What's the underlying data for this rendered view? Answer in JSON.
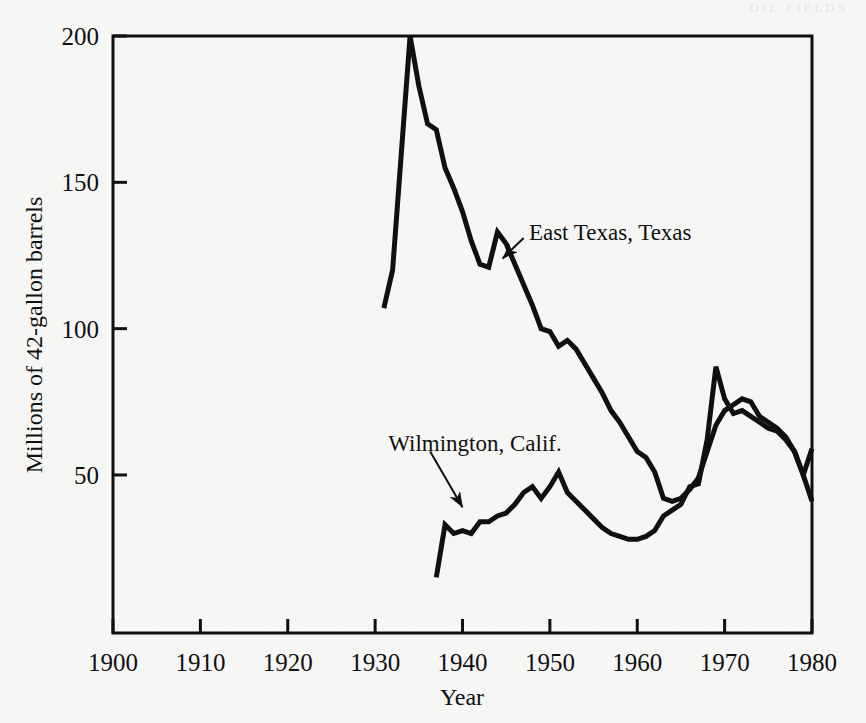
{
  "figure": {
    "page_header_fragment": "OIL FIELDS",
    "background_color": "#f6f6f4",
    "ink_color": "#101010"
  },
  "chart_data": {
    "type": "line",
    "title": "",
    "subtitle": "",
    "xlabel": "Year",
    "ylabel": "Millions of 42-gallon barrels",
    "xlim": [
      1900,
      1980
    ],
    "ylim": [
      -4,
      200
    ],
    "xticks": [
      1900,
      1910,
      1920,
      1930,
      1940,
      1950,
      1960,
      1970,
      1980
    ],
    "xtick_labels": [
      "1900",
      "1910",
      "1920",
      "1930",
      "1940",
      "1950",
      "1960",
      "1970",
      "1980"
    ],
    "yticks": [
      50,
      100,
      150,
      200
    ],
    "ytick_labels": [
      "50",
      "100",
      "150",
      "200"
    ],
    "grid": false,
    "legend_position": "inline-annotations",
    "frame": "box",
    "series": [
      {
        "name": "East Texas, Texas",
        "color": "#101010",
        "line_width": 5,
        "x": [
          1931,
          1932,
          1933,
          1934,
          1935,
          1936,
          1937,
          1938,
          1939,
          1940,
          1941,
          1942,
          1943,
          1944,
          1945,
          1946,
          1947,
          1948,
          1949,
          1950,
          1951,
          1952,
          1953,
          1954,
          1955,
          1956,
          1957,
          1958,
          1959,
          1960,
          1961,
          1962,
          1963,
          1964,
          1965,
          1966,
          1967,
          1968,
          1969,
          1970,
          1971,
          1972,
          1973,
          1974,
          1975,
          1976,
          1977,
          1978,
          1979,
          1980
        ],
        "y": [
          107,
          120,
          160,
          200,
          183,
          170,
          168,
          155,
          148,
          140,
          130,
          122,
          121,
          133,
          129,
          122,
          115,
          108,
          100,
          99,
          94,
          96,
          93,
          88,
          83,
          78,
          72,
          68,
          63,
          58,
          56,
          51,
          42,
          41,
          42,
          45,
          49,
          58,
          67,
          72,
          74,
          76,
          75,
          70,
          68,
          66,
          63,
          58,
          50,
          41
        ]
      },
      {
        "name": "Wilmington, Calif.",
        "color": "#101010",
        "line_width": 5,
        "x": [
          1937,
          1938,
          1939,
          1940,
          1941,
          1942,
          1943,
          1944,
          1945,
          1946,
          1947,
          1948,
          1949,
          1950,
          1951,
          1952,
          1953,
          1954,
          1955,
          1956,
          1957,
          1958,
          1959,
          1960,
          1961,
          1962,
          1963,
          1964,
          1965,
          1966,
          1967,
          1968,
          1969,
          1970,
          1971,
          1972,
          1973,
          1974,
          1975,
          1976,
          1977,
          1978,
          1979,
          1980
        ],
        "y": [
          15,
          33,
          30,
          31,
          30,
          34,
          34,
          36,
          37,
          40,
          44,
          46,
          42,
          46,
          51,
          44,
          41,
          38,
          35,
          32,
          30,
          29,
          28,
          28,
          29,
          31,
          36,
          38,
          40,
          46,
          47,
          62,
          87,
          76,
          71,
          72,
          70,
          68,
          66,
          65,
          62,
          58,
          50,
          59
        ]
      }
    ],
    "annotations": [
      {
        "text": "East Texas, Texas",
        "text_x": 1947.6,
        "text_y": 133,
        "arrow_from_x": 1947.0,
        "arrow_from_y": 131,
        "arrow_to_x": 1944.6,
        "arrow_to_y": 124,
        "anchor": "start"
      },
      {
        "text": "Wilmington, Calif.",
        "text_x": 1931.5,
        "text_y": 61,
        "arrow_from_x": 1936.3,
        "arrow_from_y": 58,
        "arrow_to_x": 1940.0,
        "arrow_to_y": 39,
        "anchor": "start"
      }
    ]
  }
}
